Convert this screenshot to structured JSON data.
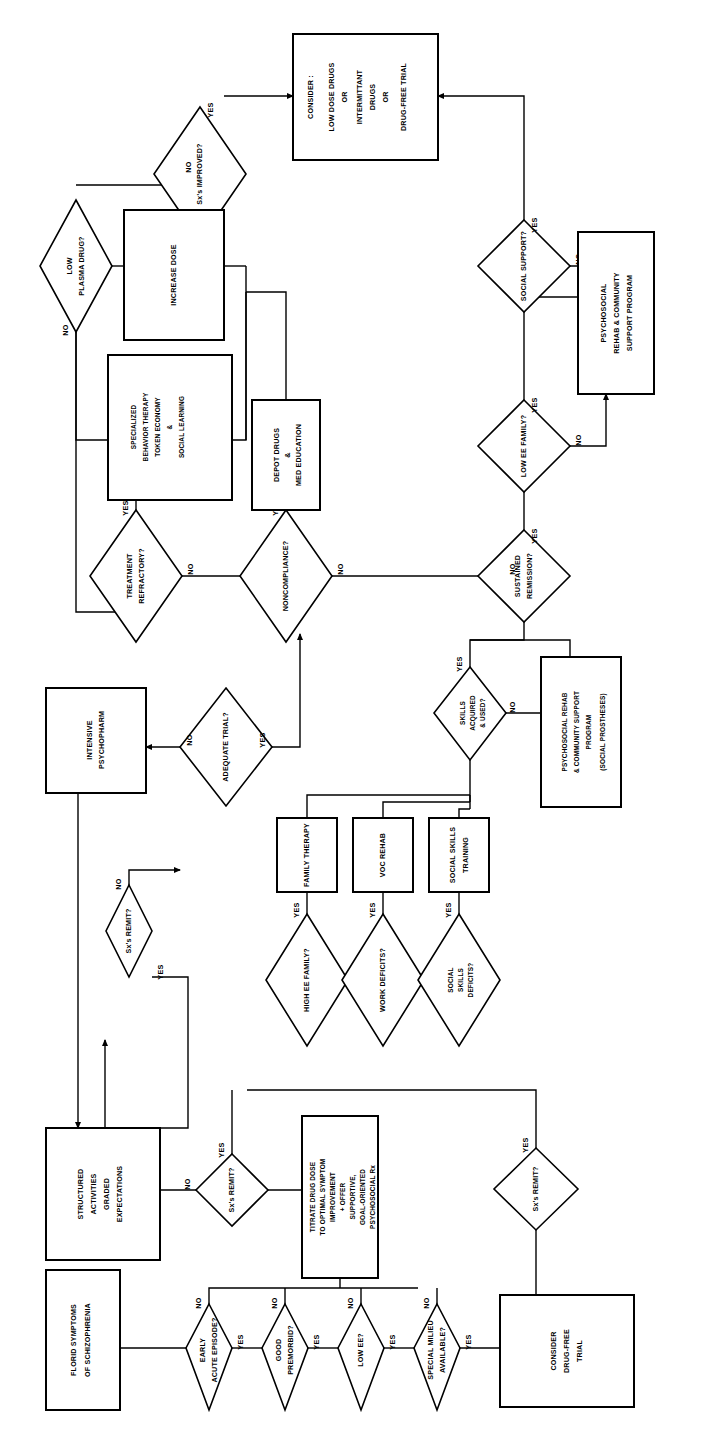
{
  "diagram": {
    "orientation": "rotated-90-ccw",
    "edge_labels": {
      "yes": "YES",
      "no": "NO"
    }
  },
  "nodes": [
    {
      "id": "florid",
      "kind": "process",
      "lines": [
        "FLORID SYMPTOMS",
        "OF SCHIZOPHRENIA"
      ]
    },
    {
      "id": "early_acute",
      "kind": "decision",
      "lines": [
        "EARLY",
        "ACUTE EPISODE?"
      ]
    },
    {
      "id": "good_premorbid",
      "kind": "decision",
      "lines": [
        "GOOD",
        "PREMORBID?"
      ]
    },
    {
      "id": "low_ee",
      "kind": "decision",
      "lines": [
        "LOW EE?"
      ]
    },
    {
      "id": "special_milieu",
      "kind": "decision",
      "lines": [
        "SPECIAL MILIEU",
        "AVAILABLE?"
      ]
    },
    {
      "id": "consider_dft",
      "kind": "process",
      "lines": [
        "CONSIDER",
        "DRUG-FREE",
        "TRIAL"
      ]
    },
    {
      "id": "sx_remit_dft",
      "kind": "decision",
      "lines": [
        "Sx's REMIT?"
      ]
    },
    {
      "id": "titrate",
      "kind": "process",
      "lines": [
        "TITRATE DRUG DOSE",
        "TO OPTIMAL SYMPTOM",
        "IMPROVEMENT",
        "+ OFFER",
        "SUPPORTIVE,",
        "GOAL-ORIENTED",
        "PSYCHOSOCIAL  Rx"
      ]
    },
    {
      "id": "sx_remit_mid",
      "kind": "decision",
      "lines": [
        "Sx's REMIT?"
      ]
    },
    {
      "id": "structured",
      "kind": "process",
      "lines": [
        "STRUCTURED",
        "ACTIVITIES",
        "GRADED",
        "EXPECTATIONS"
      ]
    },
    {
      "id": "sx_remit_up",
      "kind": "decision",
      "lines": [
        "Sx's REMIT?"
      ]
    },
    {
      "id": "adequate",
      "kind": "decision",
      "lines": [
        "ADEQUATE TRIAL?"
      ]
    },
    {
      "id": "intensive",
      "kind": "process",
      "lines": [
        "INTENSIVE",
        "PSYCHOPHARM"
      ]
    },
    {
      "id": "high_ee_fam",
      "kind": "decision",
      "lines": [
        "HIGH EE FAMILY?"
      ]
    },
    {
      "id": "family_tx",
      "kind": "process",
      "lines": [
        "FAMILY THERAPY"
      ]
    },
    {
      "id": "work_def",
      "kind": "decision",
      "lines": [
        "WORK DEFICITS?"
      ]
    },
    {
      "id": "voc_rehab",
      "kind": "process",
      "lines": [
        "VOC REHAB"
      ]
    },
    {
      "id": "soc_skill_def",
      "kind": "decision",
      "lines": [
        "SOCIAL",
        "SKILLS",
        "DEFICITS?"
      ]
    },
    {
      "id": "sst",
      "kind": "process",
      "lines": [
        "SOCIAL SKILLS",
        "TRAINING"
      ]
    },
    {
      "id": "skills_used",
      "kind": "decision",
      "lines": [
        "SKILLS",
        "ACQUIRED",
        "& USED?"
      ]
    },
    {
      "id": "psr_prosth",
      "kind": "process",
      "lines": [
        "PSYCHOSOCIAL REHAB",
        "& COMMUNITY SUPPORT",
        "PROGRAM",
        "(SOCIAL PROSTHESES)"
      ]
    },
    {
      "id": "sustained",
      "kind": "decision",
      "lines": [
        "SUSTAINED",
        "REMISSION?"
      ]
    },
    {
      "id": "low_ee_fam",
      "kind": "decision",
      "lines": [
        "LOW EE FAMILY?"
      ]
    },
    {
      "id": "psr_support",
      "kind": "process",
      "lines": [
        "PSYCHOSOCIAL",
        "REHAB & COMMUNITY",
        "SUPPORT PROGRAM"
      ]
    },
    {
      "id": "soc_support",
      "kind": "decision",
      "lines": [
        "SOCIAL SUPPORT?"
      ]
    },
    {
      "id": "consider_box",
      "kind": "process",
      "lines": [
        "CONSIDER :",
        "LOW DOSE DRUGS",
        "OR",
        "INTERMITTANT",
        "DRUGS",
        "OR",
        "DRUG-FREE TRIAL"
      ]
    },
    {
      "id": "noncompliance",
      "kind": "decision",
      "lines": [
        "NONCOMPLIANCE?"
      ]
    },
    {
      "id": "depot",
      "kind": "process",
      "lines": [
        "DEPOT DRUGS",
        "&",
        "MED EDUCATION"
      ]
    },
    {
      "id": "tx_refractory",
      "kind": "decision",
      "lines": [
        "TREATMENT",
        "REFRACTORY?"
      ]
    },
    {
      "id": "specialized",
      "kind": "process",
      "lines": [
        "SPECIALIZED",
        "BEHAVIOR THERAPY",
        "TOKEN ECONOMY",
        "&",
        "SOCIAL  LEARNING"
      ]
    },
    {
      "id": "low_plasma",
      "kind": "decision",
      "lines": [
        "LOW",
        "PLASMA DRUG?"
      ]
    },
    {
      "id": "increase_dose",
      "kind": "process",
      "lines": [
        "INCREASE DOSE"
      ]
    },
    {
      "id": "sx_improved",
      "kind": "decision",
      "lines": [
        "Sx's IMPROVED?"
      ]
    }
  ],
  "edges": [
    {
      "from": "florid",
      "to": "early_acute",
      "label": ""
    },
    {
      "from": "early_acute",
      "to": "good_premorbid",
      "label": "YES"
    },
    {
      "from": "early_acute",
      "to": "titrate",
      "label": "NO"
    },
    {
      "from": "good_premorbid",
      "to": "low_ee",
      "label": "YES"
    },
    {
      "from": "good_premorbid",
      "to": "titrate",
      "label": "NO"
    },
    {
      "from": "low_ee",
      "to": "special_milieu",
      "label": "YES"
    },
    {
      "from": "low_ee",
      "to": "titrate",
      "label": "NO"
    },
    {
      "from": "special_milieu",
      "to": "consider_dft",
      "label": "YES"
    },
    {
      "from": "special_milieu",
      "to": "titrate",
      "label": "NO"
    },
    {
      "from": "consider_dft",
      "to": "sx_remit_dft",
      "label": ""
    },
    {
      "from": "sx_remit_dft",
      "to": "skills_used",
      "label": "YES"
    },
    {
      "from": "titrate",
      "to": "sx_remit_mid",
      "label": ""
    },
    {
      "from": "sx_remit_mid",
      "to": "structured",
      "label": "NO"
    },
    {
      "from": "sx_remit_mid",
      "to": "skills_used",
      "label": "YES"
    },
    {
      "from": "structured",
      "to": "sx_remit_up",
      "label": ""
    },
    {
      "from": "sx_remit_up",
      "to": "adequate",
      "label": "NO"
    },
    {
      "from": "sx_remit_up",
      "to": "structured",
      "label": "YES"
    },
    {
      "from": "adequate",
      "to": "intensive",
      "label": "NO"
    },
    {
      "from": "adequate",
      "to": "noncompliance",
      "label": "YES"
    },
    {
      "from": "intensive",
      "to": "structured",
      "label": ""
    },
    {
      "from": "high_ee_fam",
      "to": "family_tx",
      "label": "YES"
    },
    {
      "from": "work_def",
      "to": "voc_rehab",
      "label": "YES"
    },
    {
      "from": "soc_skill_def",
      "to": "sst",
      "label": "YES"
    },
    {
      "from": "family_tx",
      "to": "skills_used",
      "label": ""
    },
    {
      "from": "voc_rehab",
      "to": "skills_used",
      "label": ""
    },
    {
      "from": "sst",
      "to": "skills_used",
      "label": ""
    },
    {
      "from": "skills_used",
      "to": "psr_prosth",
      "label": "NO"
    },
    {
      "from": "skills_used",
      "to": "sustained",
      "label": "YES"
    },
    {
      "from": "psr_prosth",
      "to": "sustained",
      "label": ""
    },
    {
      "from": "sustained",
      "to": "low_ee_fam",
      "label": "YES"
    },
    {
      "from": "sustained",
      "to": "noncompliance",
      "label": "NO"
    },
    {
      "from": "low_ee_fam",
      "to": "soc_support",
      "label": "YES"
    },
    {
      "from": "low_ee_fam",
      "to": "psr_support",
      "label": "NO"
    },
    {
      "from": "soc_support",
      "to": "consider_box",
      "label": "YES"
    },
    {
      "from": "soc_support",
      "to": "psr_support",
      "label": "NO"
    },
    {
      "from": "psr_support",
      "to": "low_ee_fam",
      "label": ""
    },
    {
      "from": "noncompliance",
      "to": "depot",
      "label": "YES"
    },
    {
      "from": "noncompliance",
      "to": "tx_refractory",
      "label": "NO"
    },
    {
      "from": "depot",
      "to": "sx_improved",
      "label": ""
    },
    {
      "from": "tx_refractory",
      "to": "specialized",
      "label": "YES"
    },
    {
      "from": "tx_refractory",
      "to": "low_plasma",
      "label": "NO"
    },
    {
      "from": "low_plasma",
      "to": "increase_dose",
      "label": "YES"
    },
    {
      "from": "low_plasma",
      "to": "specialized",
      "label": "NO"
    },
    {
      "from": "increase_dose",
      "to": "sx_improved",
      "label": ""
    },
    {
      "from": "specialized",
      "to": "sx_improved",
      "label": ""
    },
    {
      "from": "sx_improved",
      "to": "consider_box",
      "label": "YES"
    },
    {
      "from": "sx_improved",
      "to": "low_plasma",
      "label": "NO"
    }
  ]
}
